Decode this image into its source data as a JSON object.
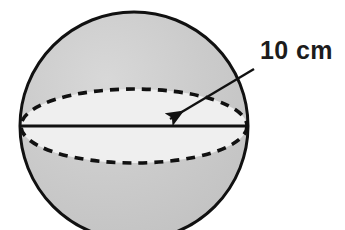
{
  "figure": {
    "type": "geometry-diagram",
    "background_color": "#ffffff",
    "outline_color": "#111111",
    "shading": {
      "cap_fill": "#c9c9c9",
      "band_fill": "#efefef",
      "highlight_fill": "#d6d6d6"
    },
    "sphere": {
      "center_x": 134,
      "center_y": 126,
      "radius": 114,
      "outline_width": 3
    },
    "equator": {
      "style": "dashed",
      "rx": 113,
      "ry": 37,
      "dash_pattern": "9 7",
      "stroke_width": 3.5
    },
    "diameter_line": {
      "style": "solid",
      "y": 126,
      "x_start": 21,
      "x_end": 248,
      "stroke_width": 2.6
    },
    "leader_arrow": {
      "tail_x": 254,
      "tail_y": 69,
      "tip_x": 164,
      "tip_y": 123,
      "stroke_width": 2.4,
      "head_length": 17,
      "head_width": 9
    }
  },
  "labels": {
    "dimension": "10 cm"
  }
}
